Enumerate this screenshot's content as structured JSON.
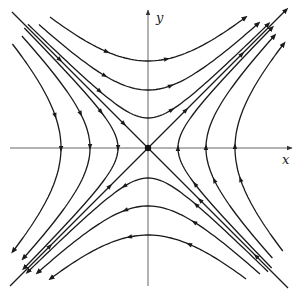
{
  "diagram": {
    "type": "phase-portrait",
    "axes": {
      "x_label": "x",
      "y_label": "y"
    },
    "origin_px": [
      148,
      148
    ],
    "equilibrium": {
      "type": "saddle",
      "marker": "filled-dot"
    },
    "separatrices": [
      {
        "name": "unstable-manifold",
        "line": "y = x",
        "flow": "away-from-origin"
      },
      {
        "name": "stable-manifold",
        "line": "y = -x",
        "flow": "toward-origin"
      }
    ],
    "trajectory_offsets_px": [
      30,
      58,
      87
    ],
    "flow_direction": {
      "top_region": "left-to-right",
      "bottom_region": "right-to-left",
      "right_region": "top-to-bottom",
      "left_region": "bottom-to-top"
    },
    "colors": {
      "line": "#1a1a1a",
      "axis": "#555555",
      "background": "#ffffff"
    }
  }
}
